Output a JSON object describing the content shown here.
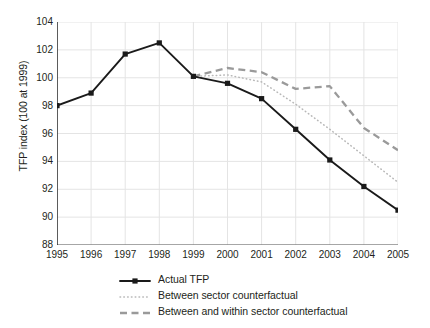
{
  "chart_data": {
    "type": "line",
    "title": "",
    "xlabel": "",
    "ylabel": "TFP index (100 at 1999)",
    "x": [
      1995,
      1996,
      1997,
      1998,
      1999,
      2000,
      2001,
      2002,
      2003,
      2004,
      2005
    ],
    "xlim": [
      1995,
      2005
    ],
    "ylim": [
      88,
      104
    ],
    "yticks": [
      88,
      90,
      92,
      94,
      96,
      98,
      100,
      102,
      104
    ],
    "xticks": [
      1995,
      1996,
      1997,
      1998,
      1999,
      2000,
      2001,
      2002,
      2003,
      2004,
      2005
    ],
    "grid": true,
    "legend_position": "below-plot",
    "series": [
      {
        "name": "Actual TFP",
        "style": "solid-with-markers",
        "color": "#1a1a1a",
        "x": [
          1995,
          1996,
          1997,
          1998,
          1999,
          2000,
          2001,
          2002,
          2003,
          2004,
          2005
        ],
        "values": [
          98.0,
          98.9,
          101.7,
          102.5,
          100.1,
          99.6,
          98.5,
          96.3,
          94.1,
          92.2,
          90.5
        ]
      },
      {
        "name": "Between sector counterfactual",
        "style": "dotted",
        "color": "#b8b8b8",
        "x": [
          1999,
          2000,
          2001,
          2002,
          2003,
          2004,
          2005
        ],
        "values": [
          100.1,
          100.2,
          99.7,
          98.1,
          96.3,
          94.4,
          92.5
        ]
      },
      {
        "name": "Between and within sector counterfactual",
        "style": "dashed",
        "color": "#9a9a9a",
        "x": [
          1999,
          2000,
          2001,
          2002,
          2003,
          2004,
          2005
        ],
        "values": [
          100.1,
          100.7,
          100.4,
          99.2,
          99.4,
          96.4,
          94.8
        ]
      }
    ]
  },
  "axis": {
    "y_title": "TFP index (100 at 1999)",
    "y_tick_labels": [
      "104",
      "102",
      "100",
      "98",
      "96",
      "94",
      "92",
      "90",
      "88"
    ],
    "x_tick_labels": [
      "1995",
      "1996",
      "1997",
      "1998",
      "1999",
      "2000",
      "2001",
      "2002",
      "2003",
      "2004",
      "2005"
    ]
  },
  "legend": {
    "items": [
      {
        "label": "Actual TFP",
        "style": "solid-with-markers"
      },
      {
        "label": "Between sector counterfactual",
        "style": "dotted"
      },
      {
        "label": "Between and within sector counterfactual",
        "style": "dashed"
      }
    ]
  },
  "colors": {
    "actual": "#1a1a1a",
    "between_sector": "#b8b8b8",
    "between_within": "#9a9a9a",
    "grid": "#e4e4e4",
    "axis": "#5a5a5a",
    "text": "#231f20"
  }
}
